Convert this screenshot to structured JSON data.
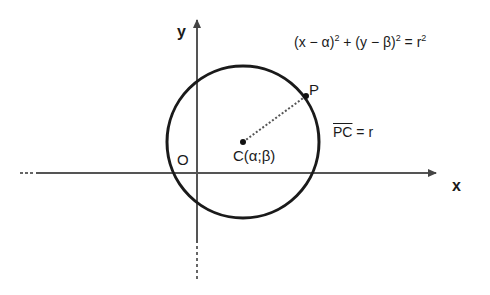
{
  "diagram": {
    "axes": {
      "x_label": "x",
      "y_label": "y",
      "origin_label": "O"
    },
    "circle": {
      "center_label": "C(α;β)",
      "point_label": "P",
      "stroke_color": "#1a1a1a"
    },
    "equation": {
      "part1": "(x − α)",
      "exp1": "2",
      "part2": " + (y − β)",
      "exp2": "2",
      "part3": " = r",
      "exp3": "2"
    },
    "radius_relation": {
      "segment": "PC",
      "rest": " = r"
    },
    "colors": {
      "axis": "#555555",
      "circle": "#1a1a1a",
      "text": "#1a1a1a",
      "background": "#ffffff"
    }
  }
}
